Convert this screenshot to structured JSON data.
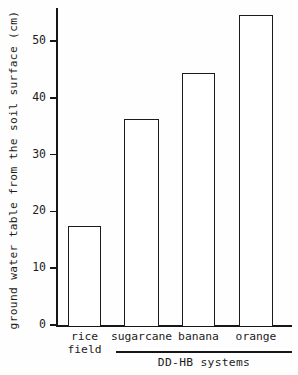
{
  "chart_data": {
    "type": "bar",
    "title": "",
    "xlabel": "DD-HB systems",
    "ylabel": "ground water table from the soil surface (cm)",
    "categories": [
      "rice field",
      "sugarcane",
      "banana",
      "orange"
    ],
    "category_lines": [
      [
        "rice",
        "field"
      ],
      [
        "sugarcane",
        ""
      ],
      [
        "banana",
        ""
      ],
      [
        "orange",
        ""
      ]
    ],
    "values": [
      17.5,
      36.2,
      44.3,
      54.5
    ],
    "ylim": [
      0,
      57
    ],
    "yticks": [
      0,
      10,
      20,
      30,
      40,
      50
    ],
    "ytick_labels": [
      "0",
      "10",
      "20",
      "30",
      "40",
      "50"
    ],
    "grid": false,
    "legend": "none",
    "group_label": "DD-HB systems",
    "group_members": [
      "sugarcane",
      "banana",
      "orange"
    ],
    "units": "cm",
    "bar_fill": "#ffffff",
    "bar_edge": "#1b1b1b",
    "axis_color": "#161616",
    "background": "#fefefe"
  },
  "axis": {
    "y_title": "ground water table from the soil surface (cm)"
  }
}
